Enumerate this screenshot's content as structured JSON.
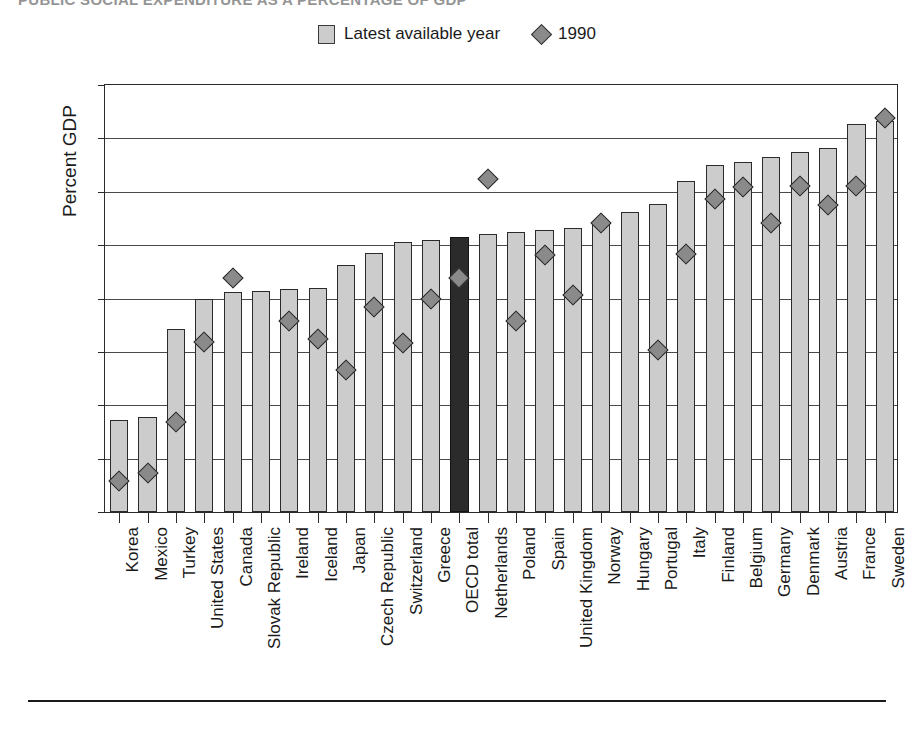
{
  "chart": {
    "title": "PUBLIC SOCIAL EXPENDITURE AS A PERCENTAGE OF GDP",
    "y_axis_label": "Percent GDP"
  },
  "legend": {
    "position": "top-center",
    "entries": [
      {
        "label": "Latest available year",
        "marker": "bar-swatch-icon",
        "color": "#cccccc"
      },
      {
        "label": "1990",
        "marker": "diamond-icon",
        "color": "#8a8a8a"
      }
    ]
  },
  "colors": {
    "bar": "#cccccc",
    "bar_highlight": "#2b2b2b",
    "marker": "#8a8a8a",
    "axis": "#2b2b2b",
    "grid": "#4a4a4a"
  },
  "chart_data": {
    "type": "bar",
    "title": "PUBLIC SOCIAL EXPENDITURE AS A PERCENTAGE OF GDP",
    "xlabel": "",
    "ylabel": "Percent GDP",
    "ylim": [
      0,
      32
    ],
    "yticks": [
      0,
      4,
      8,
      12,
      16,
      20,
      24,
      28,
      32
    ],
    "grid": true,
    "legend_position": "top-center",
    "highlight_category": "OECD total",
    "categories": [
      "Korea",
      "Mexico",
      "Turkey",
      "United States",
      "Canada",
      "Slovak Republic",
      "Ireland",
      "Iceland",
      "Japan",
      "Czech Republic",
      "Switzerland",
      "Greece",
      "OECD total",
      "Netherlands",
      "Poland",
      "Spain",
      "United Kingdom",
      "Norway",
      "Hungary",
      "Portugal",
      "Italy",
      "Finland",
      "Belgium",
      "Germany",
      "Denmark",
      "Austria",
      "France",
      "Sweden"
    ],
    "series": [
      {
        "name": "Latest available year",
        "type": "bar",
        "values": [
          6.9,
          7.1,
          13.7,
          16.0,
          16.5,
          16.6,
          16.7,
          16.8,
          18.5,
          19.4,
          20.2,
          20.4,
          20.6,
          20.8,
          21.0,
          21.1,
          21.3,
          21.6,
          22.5,
          23.1,
          24.8,
          26.0,
          26.2,
          26.6,
          27.0,
          27.3,
          29.1,
          29.3
        ]
      },
      {
        "name": "1990",
        "type": "scatter",
        "values": [
          2.9,
          3.5,
          7.3,
          13.3,
          18.1,
          null,
          14.9,
          13.5,
          11.2,
          15.9,
          13.2,
          16.5,
          18.1,
          25.5,
          14.9,
          19.8,
          16.8,
          22.2,
          null,
          12.7,
          19.9,
          24.0,
          24.9,
          22.2,
          25.0,
          23.6,
          25.0,
          30.1
        ]
      }
    ]
  }
}
